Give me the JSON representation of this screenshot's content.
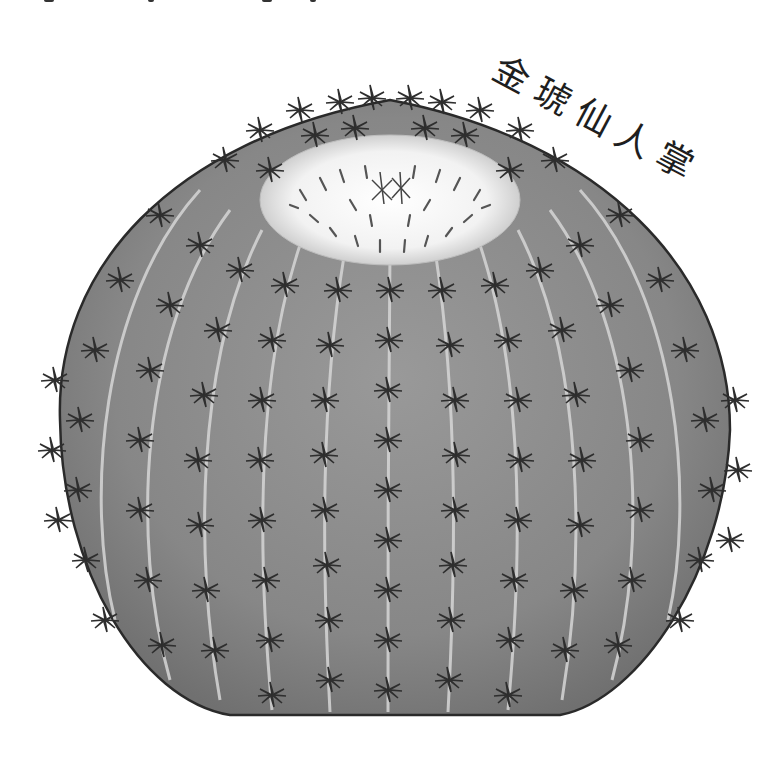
{
  "image": {
    "subject": "golden barrel cactus illustration",
    "style": "grayscale pencil/ink drawing",
    "background_color": "#ffffff",
    "body_color": "#8a8a8a",
    "body_shadow_color": "#6e6e6e",
    "crown_color": "#f4f4f4",
    "outline_color": "#2a2a2a",
    "rib_highlight_color": "#d8d8d8"
  },
  "label": {
    "text": "金琥仙人掌",
    "rotation_deg": 28
  },
  "top_edge": {
    "note": "partially cropped glyph fragments along top border"
  }
}
